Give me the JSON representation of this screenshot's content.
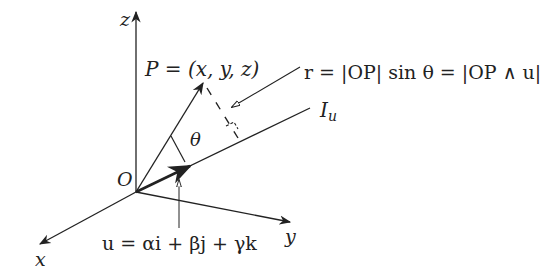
{
  "diagram": {
    "axes": {
      "z_label": "z",
      "y_label": "y",
      "x_label": "x",
      "origin_label": "O"
    },
    "point_label": "P = (x, y, z)",
    "angle_label": "θ",
    "line_label": "I",
    "line_label_sub": "u",
    "distance_formula": "r = |OP| sin θ = |OP ∧ u|",
    "vector_formula": "u = αi + βj + γk",
    "colors": {
      "stroke": "#222222",
      "background": "#ffffff"
    }
  }
}
